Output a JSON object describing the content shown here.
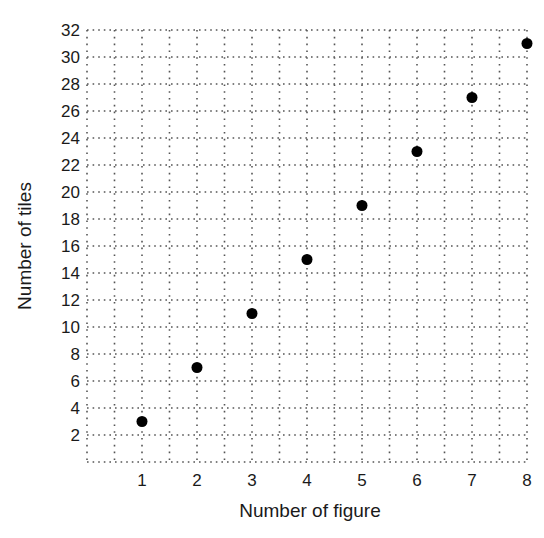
{
  "chart_data": {
    "type": "scatter",
    "title": "",
    "xlabel": "Number of figure",
    "ylabel": "Number of tiles",
    "x": [
      1,
      2,
      3,
      4,
      5,
      6,
      7,
      8
    ],
    "y": [
      3,
      7,
      11,
      15,
      19,
      23,
      27,
      31
    ],
    "series": [
      {
        "name": "tiles",
        "x": [
          1,
          2,
          3,
          4,
          5,
          6,
          7,
          8
        ],
        "values": [
          3,
          7,
          11,
          15,
          19,
          23,
          27,
          31
        ]
      }
    ],
    "xticks": [
      "1",
      "2",
      "3",
      "4",
      "5",
      "6",
      "7",
      "8"
    ],
    "yticks": [
      "2",
      "4",
      "6",
      "8",
      "10",
      "12",
      "14",
      "16",
      "18",
      "20",
      "22",
      "24",
      "26",
      "28",
      "30",
      "32"
    ],
    "xlim": [
      0,
      8
    ],
    "ylim": [
      0,
      32
    ],
    "grid": {
      "on": true,
      "style": "dotted",
      "x_step": 0.5,
      "y_step": 2
    },
    "legend": null,
    "marker_color": "#000000"
  }
}
